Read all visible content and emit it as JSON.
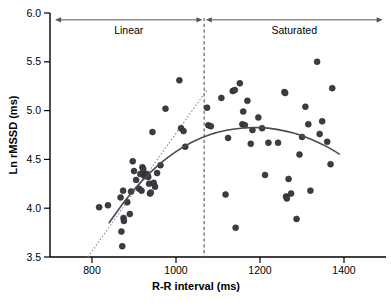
{
  "chart_data": {
    "type": "scatter",
    "title": "",
    "xlabel": "R-R interval (ms)",
    "ylabel": "Ln rMSSD (ms)",
    "xlim": [
      700,
      1500
    ],
    "ylim": [
      3.5,
      6.0
    ],
    "xticks": [
      800,
      1000,
      1200,
      1400
    ],
    "xtick_labels": [
      "800",
      "1000",
      "1200",
      "1400"
    ],
    "yticks": [
      3.5,
      4.0,
      4.5,
      5.0,
      5.5,
      6.0
    ],
    "ytick_labels": [
      "3.5",
      "4.0",
      "4.5",
      "5.0",
      "5.5",
      "6.0"
    ],
    "grid": false,
    "legend": "none",
    "marker_color": "#3c3c42",
    "points": [
      [
        817,
        4.01
      ],
      [
        838,
        4.03
      ],
      [
        868,
        4.11
      ],
      [
        870,
        3.76
      ],
      [
        872,
        3.61
      ],
      [
        874,
        4.18
      ],
      [
        875,
        3.9
      ],
      [
        876,
        3.87
      ],
      [
        884,
        4.06
      ],
      [
        890,
        3.94
      ],
      [
        893,
        4.17
      ],
      [
        897,
        4.48
      ],
      [
        900,
        4.38
      ],
      [
        905,
        4.29
      ],
      [
        912,
        4.2
      ],
      [
        915,
        4.35
      ],
      [
        918,
        4.18
      ],
      [
        920,
        4.42
      ],
      [
        922,
        4.4
      ],
      [
        925,
        4.33
      ],
      [
        927,
        4.34
      ],
      [
        928,
        4.33
      ],
      [
        930,
        4.35
      ],
      [
        932,
        4.34
      ],
      [
        934,
        4.32
      ],
      [
        936,
        4.25
      ],
      [
        938,
        4.15
      ],
      [
        940,
        4.16
      ],
      [
        944,
        4.78
      ],
      [
        947,
        4.26
      ],
      [
        950,
        4.22
      ],
      [
        955,
        4.36
      ],
      [
        963,
        4.44
      ],
      [
        975,
        5.02
      ],
      [
        1008,
        5.31
      ],
      [
        1012,
        4.82
      ],
      [
        1018,
        4.79
      ],
      [
        1022,
        4.63
      ],
      [
        1074,
        5.03
      ],
      [
        1077,
        4.85
      ],
      [
        1083,
        4.84
      ],
      [
        1108,
        5.13
      ],
      [
        1118,
        4.14
      ],
      [
        1124,
        4.72
      ],
      [
        1135,
        5.2
      ],
      [
        1140,
        5.21
      ],
      [
        1142,
        3.8
      ],
      [
        1152,
        5.28
      ],
      [
        1158,
        4.86
      ],
      [
        1160,
        4.99
      ],
      [
        1164,
        4.85
      ],
      [
        1170,
        5.1
      ],
      [
        1178,
        4.66
      ],
      [
        1182,
        4.8
      ],
      [
        1196,
        4.93
      ],
      [
        1205,
        4.82
      ],
      [
        1212,
        4.34
      ],
      [
        1220,
        4.67
      ],
      [
        1243,
        4.67
      ],
      [
        1258,
        5.19
      ],
      [
        1260,
        5.18
      ],
      [
        1262,
        4.12
      ],
      [
        1264,
        4.1
      ],
      [
        1268,
        4.3
      ],
      [
        1274,
        4.15
      ],
      [
        1287,
        3.89
      ],
      [
        1294,
        4.55
      ],
      [
        1300,
        4.73
      ],
      [
        1308,
        5.04
      ],
      [
        1315,
        4.86
      ],
      [
        1320,
        4.18
      ],
      [
        1336,
        5.5
      ],
      [
        1342,
        4.76
      ],
      [
        1348,
        4.89
      ],
      [
        1360,
        4.68
      ],
      [
        1368,
        4.45
      ],
      [
        1372,
        5.23
      ]
    ],
    "fit_curve": {
      "name": "quadratic-fit",
      "color": "#4a4a52",
      "x_range": [
        840,
        1390
      ],
      "points": [
        [
          840,
          3.845
        ],
        [
          880,
          4.085
        ],
        [
          920,
          4.285
        ],
        [
          960,
          4.45
        ],
        [
          1000,
          4.58
        ],
        [
          1040,
          4.68
        ],
        [
          1080,
          4.752
        ],
        [
          1120,
          4.798
        ],
        [
          1160,
          4.822
        ],
        [
          1200,
          4.826
        ],
        [
          1240,
          4.808
        ],
        [
          1280,
          4.77
        ],
        [
          1320,
          4.71
        ],
        [
          1360,
          4.628
        ],
        [
          1390,
          4.552
        ]
      ]
    },
    "linear_fit": {
      "name": "linear-fit-dotted",
      "color": "#8d8d95",
      "x_range": [
        790,
        1075
      ],
      "points": [
        [
          790,
          3.5
        ],
        [
          1075,
          5.22
        ]
      ]
    },
    "divider": {
      "x": 1067,
      "style": "dashed",
      "color": "#55555d"
    },
    "annotations": [
      {
        "label": "Linear",
        "x_start": 712,
        "x_end": 1063,
        "y": 5.93,
        "arrow": "double-ended"
      },
      {
        "label": "Saturated",
        "x_start": 1071,
        "x_end": 1492,
        "y": 5.93,
        "arrow": "double-ended"
      }
    ]
  },
  "axes": {
    "x_title": "R-R interval (ms)",
    "y_title": "Ln rMSSD (ms)"
  }
}
